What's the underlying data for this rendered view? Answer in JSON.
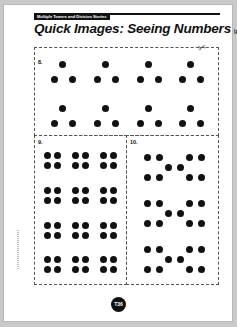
{
  "header": {
    "tag": "Multiple Towers and Division Stories"
  },
  "title": {
    "main": "Quick Images: Seeing Numbers",
    "sub": "(page 3 of 6)"
  },
  "sections": [
    {
      "label": "8.",
      "pattern": "triangles of 3 dots",
      "dots": [
        [
          62,
          64
        ],
        [
          54,
          79
        ],
        [
          72,
          79
        ],
        [
          105,
          64
        ],
        [
          97,
          79
        ],
        [
          115,
          79
        ],
        [
          148,
          64
        ],
        [
          140,
          79
        ],
        [
          158,
          79
        ],
        [
          190,
          64
        ],
        [
          182,
          79
        ],
        [
          200,
          79
        ],
        [
          62,
          108
        ],
        [
          54,
          123
        ],
        [
          72,
          123
        ],
        [
          105,
          108
        ],
        [
          97,
          123
        ],
        [
          115,
          123
        ],
        [
          148,
          108
        ],
        [
          140,
          123
        ],
        [
          158,
          123
        ],
        [
          190,
          108
        ],
        [
          182,
          123
        ],
        [
          200,
          123
        ]
      ]
    },
    {
      "label": "9.",
      "pattern": "2x2 squares, 4 rows x 3 columns",
      "dots": [
        [
          47,
          155
        ],
        [
          57,
          155
        ],
        [
          47,
          165
        ],
        [
          57,
          165
        ],
        [
          75,
          155
        ],
        [
          85,
          155
        ],
        [
          75,
          165
        ],
        [
          85,
          165
        ],
        [
          103,
          155
        ],
        [
          113,
          155
        ],
        [
          103,
          165
        ],
        [
          113,
          165
        ],
        [
          47,
          190
        ],
        [
          57,
          190
        ],
        [
          47,
          200
        ],
        [
          57,
          200
        ],
        [
          75,
          190
        ],
        [
          85,
          190
        ],
        [
          75,
          200
        ],
        [
          85,
          200
        ],
        [
          103,
          190
        ],
        [
          113,
          190
        ],
        [
          103,
          200
        ],
        [
          113,
          200
        ],
        [
          47,
          225
        ],
        [
          57,
          225
        ],
        [
          47,
          235
        ],
        [
          57,
          235
        ],
        [
          75,
          225
        ],
        [
          85,
          225
        ],
        [
          75,
          235
        ],
        [
          85,
          235
        ],
        [
          103,
          225
        ],
        [
          113,
          225
        ],
        [
          103,
          235
        ],
        [
          113,
          235
        ],
        [
          47,
          259
        ],
        [
          57,
          259
        ],
        [
          47,
          269
        ],
        [
          57,
          269
        ],
        [
          75,
          259
        ],
        [
          85,
          259
        ],
        [
          75,
          269
        ],
        [
          85,
          269
        ],
        [
          103,
          259
        ],
        [
          113,
          259
        ],
        [
          103,
          269
        ],
        [
          113,
          269
        ]
      ]
    },
    {
      "label": "10.",
      "pattern": "groups of 10 (4 + 2 + 4)",
      "dots": [
        [
          147,
          157
        ],
        [
          159,
          157
        ],
        [
          147,
          177
        ],
        [
          159,
          177
        ],
        [
          168,
          167
        ],
        [
          180,
          167
        ],
        [
          189,
          157
        ],
        [
          201,
          157
        ],
        [
          189,
          177
        ],
        [
          201,
          177
        ],
        [
          147,
          203
        ],
        [
          159,
          203
        ],
        [
          147,
          223
        ],
        [
          159,
          223
        ],
        [
          168,
          213
        ],
        [
          180,
          213
        ],
        [
          189,
          203
        ],
        [
          201,
          203
        ],
        [
          189,
          223
        ],
        [
          201,
          223
        ],
        [
          147,
          249
        ],
        [
          159,
          249
        ],
        [
          147,
          269
        ],
        [
          159,
          269
        ],
        [
          168,
          259
        ],
        [
          180,
          259
        ],
        [
          189,
          249
        ],
        [
          201,
          249
        ],
        [
          189,
          269
        ],
        [
          201,
          269
        ]
      ]
    }
  ],
  "footer": {
    "page_badge": "T36"
  },
  "icons": {
    "scissors": "scissors-icon"
  }
}
